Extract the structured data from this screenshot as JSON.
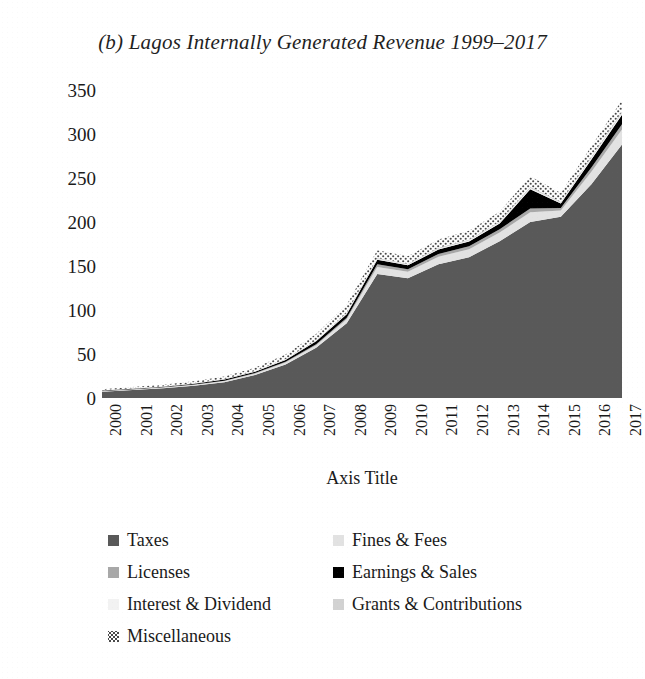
{
  "figure": {
    "title": "(b) Lagos Internally Generated Revenue 1999–2017"
  },
  "axes": {
    "y_title": "(N) Billions",
    "x_title": "Axis Title",
    "y_ticks": [
      "0",
      "50",
      "100",
      "150",
      "200",
      "250",
      "300",
      "350"
    ],
    "x_ticks": [
      "2000",
      "2001",
      "2002",
      "2003",
      "2004",
      "2005",
      "2006",
      "2007",
      "2008",
      "2009",
      "2010",
      "2011",
      "2012",
      "2013",
      "2014",
      "2015",
      "2016",
      "2017"
    ]
  },
  "legend": {
    "rows": [
      [
        {
          "label": "Taxes",
          "color": "#595959",
          "pattern": "solid"
        },
        {
          "label": "Fines & Fees",
          "color": "#e2e2e2",
          "pattern": "solid"
        }
      ],
      [
        {
          "label": "Licenses",
          "color": "#a8a8a8",
          "pattern": "solid"
        },
        {
          "label": "Earnings & Sales",
          "color": "#000000",
          "pattern": "solid"
        }
      ],
      [
        {
          "label": "Interest & Dividend",
          "color": "#f2f2f2",
          "pattern": "solid"
        },
        {
          "label": "Grants & Contributions",
          "color": "#d2d2d2",
          "pattern": "solid"
        }
      ],
      [
        {
          "label": "Miscellaneous",
          "color": "#4a4a4a",
          "pattern": "stipple"
        }
      ]
    ]
  },
  "chart_data": {
    "type": "area",
    "stacked": true,
    "title": "(b) Lagos Internally Generated Revenue 1999–2017",
    "xlabel": "Axis Title",
    "ylabel": "(N) Billions",
    "ylim": [
      0,
      350
    ],
    "ytick_step": 50,
    "grid": false,
    "legend_position": "bottom",
    "categories": [
      "2000",
      "2001",
      "2002",
      "2003",
      "2004",
      "2005",
      "2006",
      "2007",
      "2008",
      "2009",
      "2010",
      "2011",
      "2012",
      "2013",
      "2014",
      "2015",
      "2016",
      "2017"
    ],
    "series": [
      {
        "name": "Taxes",
        "color": "#595959",
        "values": [
          7,
          9,
          11,
          14,
          18,
          26,
          38,
          57,
          85,
          141,
          136,
          152,
          160,
          178,
          200,
          206,
          243,
          288
        ]
      },
      {
        "name": "Fines & Fees",
        "color": "#e2e2e2",
        "values": [
          0.6,
          0.7,
          0.8,
          0.9,
          1.2,
          1.6,
          2.2,
          3.0,
          4.5,
          8.0,
          7.5,
          8.5,
          9.0,
          10.0,
          11.0,
          7.0,
          14.0,
          17.0
        ]
      },
      {
        "name": "Licenses",
        "color": "#a8a8a8",
        "values": [
          0.3,
          0.3,
          0.4,
          0.4,
          0.5,
          0.7,
          0.9,
          1.2,
          1.8,
          3.0,
          2.8,
          3.2,
          3.4,
          3.8,
          4.2,
          3.0,
          5.0,
          6.0
        ]
      },
      {
        "name": "Earnings & Sales",
        "color": "#000000",
        "values": [
          0.5,
          0.6,
          0.7,
          0.9,
          1.2,
          1.6,
          2.2,
          3.2,
          4.0,
          5.0,
          4.5,
          5.0,
          5.5,
          6.5,
          22.0,
          5.0,
          9.0,
          11.0
        ]
      },
      {
        "name": "Interest & Dividend",
        "color": "#f2f2f2",
        "values": [
          0.2,
          0.2,
          0.2,
          0.3,
          0.3,
          0.4,
          0.5,
          0.6,
          0.8,
          1.0,
          0.9,
          1.0,
          1.1,
          1.2,
          1.4,
          1.0,
          1.6,
          1.8
        ]
      },
      {
        "name": "Grants & Contributions",
        "color": "#d2d2d2",
        "values": [
          0.2,
          0.2,
          0.2,
          0.3,
          0.3,
          0.4,
          0.5,
          0.6,
          0.8,
          1.0,
          0.9,
          1.0,
          1.1,
          1.2,
          1.4,
          1.0,
          1.6,
          1.8
        ]
      },
      {
        "name": "Miscellaneous",
        "color": "#4a4a4a",
        "pattern": "stipple",
        "values": [
          1.2,
          1.5,
          1.8,
          2.2,
          2.8,
          3.8,
          5.0,
          7.0,
          9.0,
          9.0,
          8.5,
          9.5,
          10.0,
          11.0,
          12.0,
          10.0,
          12.0,
          13.0
        ]
      }
    ],
    "totals": [
      10,
      12.5,
      15.1,
      19.0,
      24.3,
      34.5,
      49.3,
      72.6,
      105.9,
      168.0,
      161.1,
      180.2,
      190.1,
      211.7,
      252.0,
      233.0,
      286.2,
      338.6
    ]
  }
}
